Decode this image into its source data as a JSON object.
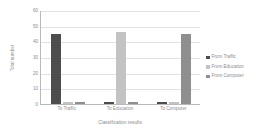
{
  "chart_data": {
    "type": "bar",
    "title": "",
    "xlabel": "Classification results",
    "ylabel": "Total number",
    "categories": [
      "To Traffic",
      "To Education",
      "To Computer"
    ],
    "series": [
      {
        "name": "From Traffic",
        "color": "#4d4d4d",
        "values": [
          45,
          1,
          1
        ]
      },
      {
        "name": "From Education",
        "color": "#c3c3c3",
        "values": [
          1,
          46,
          1
        ]
      },
      {
        "name": "From Computer",
        "color": "#8f8f8f",
        "values": [
          1,
          1,
          45
        ]
      }
    ],
    "ylim": [
      0,
      60
    ],
    "yticks": [
      0,
      10,
      20,
      30,
      40,
      50,
      60
    ],
    "ytick_labels": [
      "0",
      "10",
      "20",
      "30",
      "40",
      "50",
      "60"
    ],
    "grid": true,
    "legend_position": "right",
    "axis_color": "#b9b9b9",
    "grid_color": "#e2e2e2",
    "text_color": "#8d8d8d"
  }
}
